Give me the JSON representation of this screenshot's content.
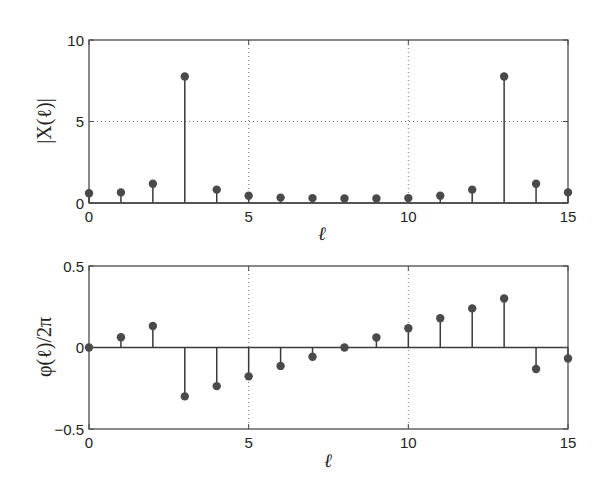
{
  "chart_data": [
    {
      "type": "stem",
      "title": "",
      "xlabel": "ℓ",
      "ylabel": "|X(ℓ)|",
      "xlim": [
        0,
        15
      ],
      "ylim": [
        0,
        10
      ],
      "xticks": [
        0,
        5,
        10,
        15
      ],
      "yticks": [
        0,
        5,
        10
      ],
      "grid": true,
      "x": [
        0,
        1,
        2,
        3,
        4,
        5,
        6,
        7,
        8,
        9,
        10,
        11,
        12,
        13,
        14,
        15
      ],
      "values": [
        0.6,
        0.65,
        1.18,
        7.76,
        0.82,
        0.45,
        0.33,
        0.3,
        0.28,
        0.28,
        0.3,
        0.45,
        0.82,
        7.76,
        1.18,
        0.65
      ]
    },
    {
      "type": "stem",
      "title": "",
      "xlabel": "ℓ",
      "ylabel": "φ(ℓ)/2π",
      "xlim": [
        0,
        15
      ],
      "ylim": [
        -0.5,
        0.5
      ],
      "xticks": [
        0,
        5,
        10,
        15
      ],
      "yticks": [
        -0.5,
        0,
        0.5
      ],
      "grid": true,
      "x": [
        0,
        1,
        2,
        3,
        4,
        5,
        6,
        7,
        8,
        9,
        10,
        11,
        12,
        13,
        14,
        15
      ],
      "values": [
        0,
        0.063,
        0.132,
        -0.3,
        -0.237,
        -0.177,
        -0.113,
        -0.057,
        0,
        0.061,
        0.118,
        0.179,
        0.24,
        0.301,
        -0.132,
        -0.067
      ]
    }
  ],
  "plots": {
    "top": {
      "ylabel": "|X(ℓ)|",
      "xlabel": "ℓ",
      "xtick_labels": [
        "0",
        "5",
        "10",
        "15"
      ],
      "ytick_labels": [
        "0",
        "5",
        "10"
      ]
    },
    "bottom": {
      "ylabel": "φ(ℓ)/2π",
      "xlabel": "ℓ",
      "xtick_labels": [
        "0",
        "5",
        "10",
        "15"
      ],
      "ytick_labels": [
        "−0.5",
        "0",
        "0.5"
      ]
    }
  }
}
